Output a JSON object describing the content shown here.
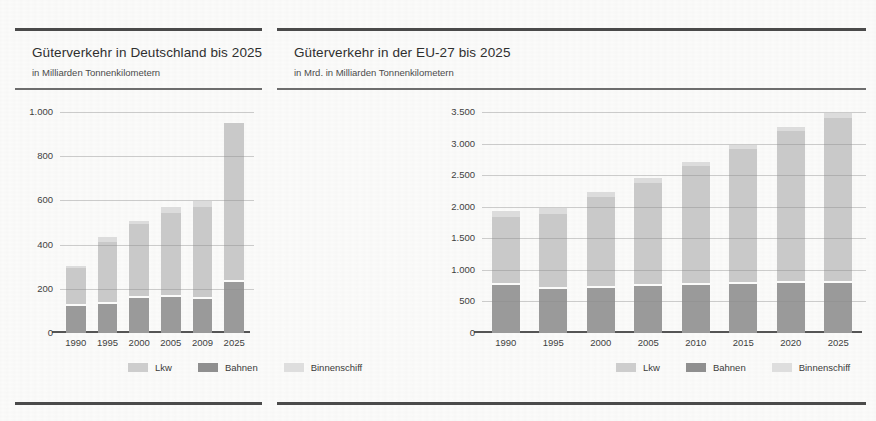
{
  "panels": [
    {
      "title": "Güterverkehr in Deutschland bis 2025",
      "subtitle": "in Milliarden Tonnenkilometern",
      "legend": [
        {
          "label": "Lkw",
          "color": "#cdcdcd"
        },
        {
          "label": "Bahnen",
          "color": "#8f8f8f"
        },
        {
          "label": "Binnenschiff",
          "color": "#dedede"
        }
      ]
    },
    {
      "title": "Güterverkehr in der EU-27 bis 2025",
      "subtitle": "in Mrd. in Milliarden Tonnenkilometern",
      "legend": [
        {
          "label": "Lkw",
          "color": "#cdcdcd"
        },
        {
          "label": "Bahnen",
          "color": "#8f8f8f"
        },
        {
          "label": "Binnenschiff",
          "color": "#dedede"
        }
      ]
    }
  ],
  "chart_data": [
    {
      "type": "bar",
      "stacked": true,
      "title": "Güterverkehr in Deutschland bis 2025",
      "subtitle": "in Milliarden Tonnenkilometern",
      "xlabel": "",
      "ylabel": "in Milliarden Tonnenkilometern",
      "ylim": [
        0,
        1000
      ],
      "yticks": [
        0,
        200,
        400,
        600,
        800,
        1000
      ],
      "ytick_labels": [
        "0",
        "200",
        "400",
        "600",
        "800",
        "1.000"
      ],
      "grid": true,
      "legend_position": "bottom",
      "categories": [
        "1990",
        "1995",
        "2000",
        "2005",
        "2009",
        "2025"
      ],
      "series": [
        {
          "name": "Bahnen",
          "color": "#9a9a9a",
          "values": [
            120,
            130,
            160,
            165,
            155,
            230
          ]
        },
        {
          "name": "Lkw",
          "color": "#c9c9c9",
          "values": [
            165,
            275,
            325,
            370,
            405,
            710
          ]
        },
        {
          "name": "Binnenschiff",
          "color": "#dcdcdc",
          "values": [
            10,
            20,
            15,
            25,
            30,
            0
          ]
        }
      ],
      "totals": [
        295,
        425,
        500,
        560,
        590,
        940
      ]
    },
    {
      "type": "bar",
      "stacked": true,
      "title": "Güterverkehr in der EU-27 bis 2025",
      "subtitle": "in Mrd. in Milliarden Tonnenkilometern",
      "xlabel": "",
      "ylabel": "in Milliarden Tonnenkilometern",
      "ylim": [
        0,
        3500
      ],
      "yticks": [
        0,
        500,
        1000,
        1500,
        2000,
        2500,
        3000,
        3500
      ],
      "ytick_labels": [
        "0",
        "500",
        "1.000",
        "1.500",
        "2.000",
        "2.500",
        "3.000",
        "3.500"
      ],
      "grid": true,
      "legend_position": "bottom",
      "categories": [
        "1990",
        "1995",
        "2000",
        "2005",
        "2010",
        "2015",
        "2020",
        "2025"
      ],
      "series": [
        {
          "name": "Bahnen",
          "color": "#9a9a9a",
          "values": [
            760,
            700,
            720,
            740,
            760,
            780,
            790,
            800
          ]
        },
        {
          "name": "Lkw",
          "color": "#c9c9c9",
          "values": [
            1040,
            1150,
            1400,
            1600,
            1860,
            2100,
            2370,
            2580
          ]
        },
        {
          "name": "Binnenschiff",
          "color": "#dcdcdc",
          "values": [
            100,
            100,
            80,
            80,
            60,
            70,
            70,
            70
          ]
        }
      ],
      "totals": [
        1900,
        1950,
        2200,
        2420,
        2680,
        2950,
        3230,
        3450
      ]
    }
  ]
}
